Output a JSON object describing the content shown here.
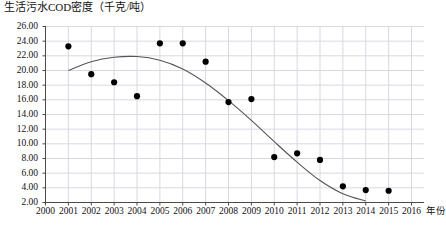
{
  "chart_data": {
    "type": "scatter",
    "title": "生活污水COD密度（千克/吨）",
    "xlabel": "年份",
    "ylabel": "",
    "xlim": [
      2000,
      2016
    ],
    "ylim": [
      2.0,
      26.0
    ],
    "grid": true,
    "legend": "none",
    "x_ticks": [
      "2000",
      "2001",
      "2002",
      "2003",
      "2004",
      "2005",
      "2006",
      "2007",
      "2008",
      "2009",
      "2010",
      "2011",
      "2012",
      "2013",
      "2014",
      "2015",
      "2016"
    ],
    "y_ticks": [
      "2.00",
      "4.00",
      "6.00",
      "8.00",
      "10.00",
      "12.00",
      "14.00",
      "16.00",
      "18.00",
      "20.00",
      "22.00",
      "24.00",
      "26.00"
    ],
    "series": [
      {
        "name": "生活污水COD密度",
        "marker": "filled-circle",
        "color": "#000000",
        "x": [
          2001,
          2002,
          2003,
          2004,
          2005,
          2006,
          2007,
          2008,
          2009,
          2010,
          2011,
          2012,
          2013,
          2014,
          2015
        ],
        "values": [
          23.3,
          19.5,
          18.4,
          16.5,
          23.7,
          23.7,
          21.2,
          15.7,
          16.1,
          8.2,
          8.7,
          7.8,
          4.2,
          3.7,
          3.6
        ]
      },
      {
        "name": "趋势线",
        "type": "trend-curve",
        "color": "#555555",
        "x": [
          2001,
          2002,
          2003,
          2004,
          2005,
          2006,
          2007,
          2008,
          2009,
          2010,
          2011,
          2012,
          2013,
          2014
        ],
        "values": [
          20.0,
          21.2,
          21.8,
          21.9,
          21.4,
          20.2,
          18.3,
          15.9,
          13.2,
          10.3,
          7.5,
          5.0,
          3.2,
          2.2
        ]
      }
    ]
  },
  "colors": {
    "point": "#000000",
    "curve": "#555555",
    "grid": "#d6d9e0",
    "axis": "#4a4a4a",
    "text": "#111111"
  }
}
